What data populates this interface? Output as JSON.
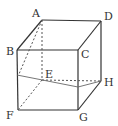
{
  "diagram": {
    "type": "cube",
    "vertices": {
      "A": {
        "label": "A",
        "x": 42,
        "y": 20
      },
      "B": {
        "label": "B",
        "x": 17,
        "y": 50
      },
      "C": {
        "label": "C",
        "x": 78,
        "y": 50
      },
      "D": {
        "label": "D",
        "x": 101,
        "y": 21
      },
      "E": {
        "label": "E",
        "x": 42,
        "y": 80
      },
      "F": {
        "label": "F",
        "x": 18,
        "y": 110
      },
      "G": {
        "label": "G",
        "x": 78,
        "y": 110
      },
      "H": {
        "label": "H",
        "x": 101,
        "y": 81
      }
    },
    "section_points": {
      "P_on_BF": {
        "x": 17,
        "y": 75
      },
      "Q_on_CG": {
        "x": 78,
        "y": 87
      }
    },
    "colors": {
      "solid": "#333333",
      "dashed": "#555555",
      "section": "#666666"
    }
  }
}
